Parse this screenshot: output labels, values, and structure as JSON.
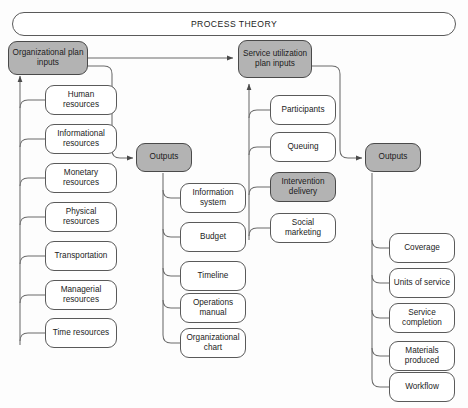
{
  "diagram": {
    "title": "PROCESS THEORY",
    "type": "process-theory-flowchart",
    "colors": {
      "shaded_fill": "#b3b3b3",
      "plain_fill": "#ffffff",
      "stroke": "#5a5a5a",
      "text": "#1b1b1b",
      "background": "#fdfdfd"
    }
  },
  "banner": {
    "label": "PROCESS THEORY"
  },
  "columns": {
    "organizational_plan_inputs": {
      "header": "Organizational plan inputs",
      "header_shaded": true,
      "items": [
        "Human resources",
        "Informational resources",
        "Monetary resources",
        "Physical resources",
        "Transportation",
        "Managerial resources",
        "Time resources"
      ]
    },
    "organizational_outputs": {
      "header": "Outputs",
      "header_shaded": true,
      "items": [
        "Information system",
        "Budget",
        "Timeline",
        "Operations manual",
        "Organizational chart"
      ]
    },
    "service_utilization_plan_inputs": {
      "header": "Service utilization plan inputs",
      "header_shaded": true,
      "items": [
        "Participants",
        "Queuing",
        "Intervention delivery",
        "Social marketing"
      ],
      "shaded_items": [
        "Intervention delivery"
      ]
    },
    "service_outputs": {
      "header": "Outputs",
      "header_shaded": true,
      "items": [
        "Coverage",
        "Units of service",
        "Service completion",
        "Materials produced",
        "Workflow"
      ]
    }
  },
  "flows": [
    {
      "from": "Organizational plan inputs",
      "to": "Service utilization plan inputs",
      "arrow": true
    },
    {
      "from": "Organizational plan inputs",
      "to": "Outputs (organizational)",
      "arrow": true
    },
    {
      "from": "Service utilization plan inputs",
      "to": "Outputs (service)",
      "arrow": true
    }
  ]
}
